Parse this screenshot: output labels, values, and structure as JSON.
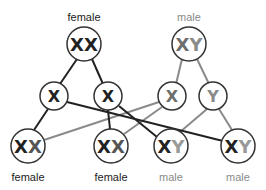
{
  "colors": {
    "female": "#222222",
    "male": "#8a8a8a",
    "circle_stroke": "#333333",
    "background": "#ffffff"
  },
  "parents": {
    "female": {
      "label": "female",
      "genotype_a": "X",
      "genotype_b": "X"
    },
    "male": {
      "label": "male",
      "genotype_a": "X",
      "genotype_b": "Y"
    }
  },
  "gametes": [
    {
      "allele": "X",
      "from": "female"
    },
    {
      "allele": "X",
      "from": "female"
    },
    {
      "allele": "X",
      "from": "male"
    },
    {
      "allele": "Y",
      "from": "male"
    }
  ],
  "offspring": [
    {
      "label": "female",
      "genotype_a": "X",
      "genotype_b": "X"
    },
    {
      "label": "female",
      "genotype_a": "X",
      "genotype_b": "X"
    },
    {
      "label": "male",
      "genotype_a": "X",
      "genotype_b": "Y"
    },
    {
      "label": "male",
      "genotype_a": "X",
      "genotype_b": "Y"
    }
  ]
}
